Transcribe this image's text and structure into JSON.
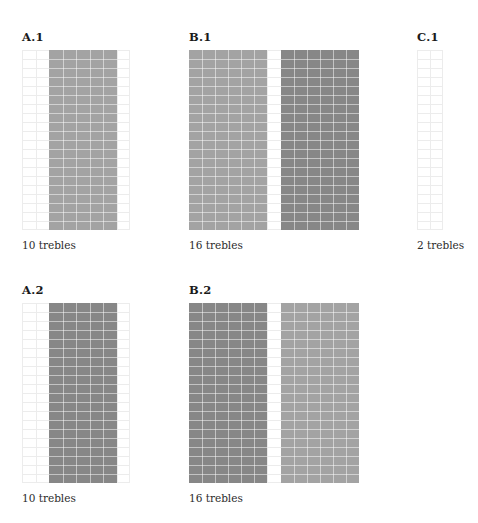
{
  "figure": {
    "width": 478,
    "height": 523,
    "background": "#ffffff",
    "grid_line_color": "#ececec",
    "cell_line_color": "rgba(255,255,255,0.5)",
    "shades": {
      "light": "#a3a3a3",
      "dark": "#878787"
    }
  },
  "chart_data": {
    "type": "heatmap",
    "title": "",
    "xlabel": "",
    "ylabel": "",
    "grid": true,
    "legend": "none",
    "panels": [
      {
        "id": "A1",
        "title": "A.1",
        "caption": "10 trebles",
        "trebles": 10,
        "columns": 8,
        "rows": 20,
        "blocks": [
          {
            "start_col": 2,
            "end_col": 6,
            "shade": "light",
            "color": "#a3a3a3"
          }
        ]
      },
      {
        "id": "B1",
        "title": "B.1",
        "caption": "16 trebles",
        "trebles": 16,
        "columns": 13,
        "rows": 20,
        "blocks": [
          {
            "start_col": 0,
            "end_col": 5,
            "shade": "light",
            "color": "#a3a3a3"
          },
          {
            "start_col": 7,
            "end_col": 12,
            "shade": "dark",
            "color": "#878787"
          }
        ]
      },
      {
        "id": "C1",
        "title": "C.1",
        "caption": "2 trebles",
        "trebles": 2,
        "columns": 2,
        "rows": 20,
        "blocks": []
      },
      {
        "id": "A2",
        "title": "A.2",
        "caption": "10 trebles",
        "trebles": 10,
        "columns": 8,
        "rows": 20,
        "blocks": [
          {
            "start_col": 2,
            "end_col": 6,
            "shade": "dark",
            "color": "#878787"
          }
        ]
      },
      {
        "id": "B2",
        "title": "B.2",
        "caption": "16 trebles",
        "trebles": 16,
        "columns": 13,
        "rows": 20,
        "blocks": [
          {
            "start_col": 0,
            "end_col": 5,
            "shade": "dark",
            "color": "#878787"
          },
          {
            "start_col": 7,
            "end_col": 12,
            "shade": "light",
            "color": "#a3a3a3"
          }
        ]
      }
    ]
  },
  "layout": {
    "panels": [
      {
        "id": "A1",
        "left": 22,
        "title_top": 30,
        "chart_top": 50,
        "chart_width": 108,
        "chart_height": 180,
        "caption_top": 238
      },
      {
        "id": "B1",
        "left": 189,
        "title_top": 30,
        "chart_top": 50,
        "chart_width": 170,
        "chart_height": 180,
        "caption_top": 238
      },
      {
        "id": "C1",
        "left": 417,
        "title_top": 30,
        "chart_top": 50,
        "chart_width": 26,
        "chart_height": 180,
        "caption_top": 238
      },
      {
        "id": "A2",
        "left": 22,
        "title_top": 283,
        "chart_top": 303,
        "chart_width": 108,
        "chart_height": 180,
        "caption_top": 491
      },
      {
        "id": "B2",
        "left": 189,
        "title_top": 283,
        "chart_top": 303,
        "chart_width": 170,
        "chart_height": 180,
        "caption_top": 491
      }
    ]
  }
}
